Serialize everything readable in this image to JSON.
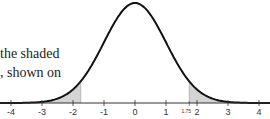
{
  "text": {
    "line1": "the shaded",
    "line2": ", shown on"
  },
  "chart_data": {
    "type": "area",
    "title": "",
    "xlabel": "",
    "ylabel": "",
    "xlim": [
      -4.2,
      4.2
    ],
    "x_ticks": [
      "-4",
      "-3",
      "-2",
      "-1",
      "0",
      "1",
      "2",
      "3",
      "4"
    ],
    "annotations": [
      {
        "x": 1.75,
        "label": "1.75"
      }
    ],
    "shaded_regions": [
      {
        "from": -4,
        "to": -1.75
      },
      {
        "from": 1.75,
        "to": 4
      }
    ],
    "grid": false,
    "colors": {
      "curve": "#111111",
      "shade": "#d4d4d4",
      "axis": "#333333"
    }
  }
}
